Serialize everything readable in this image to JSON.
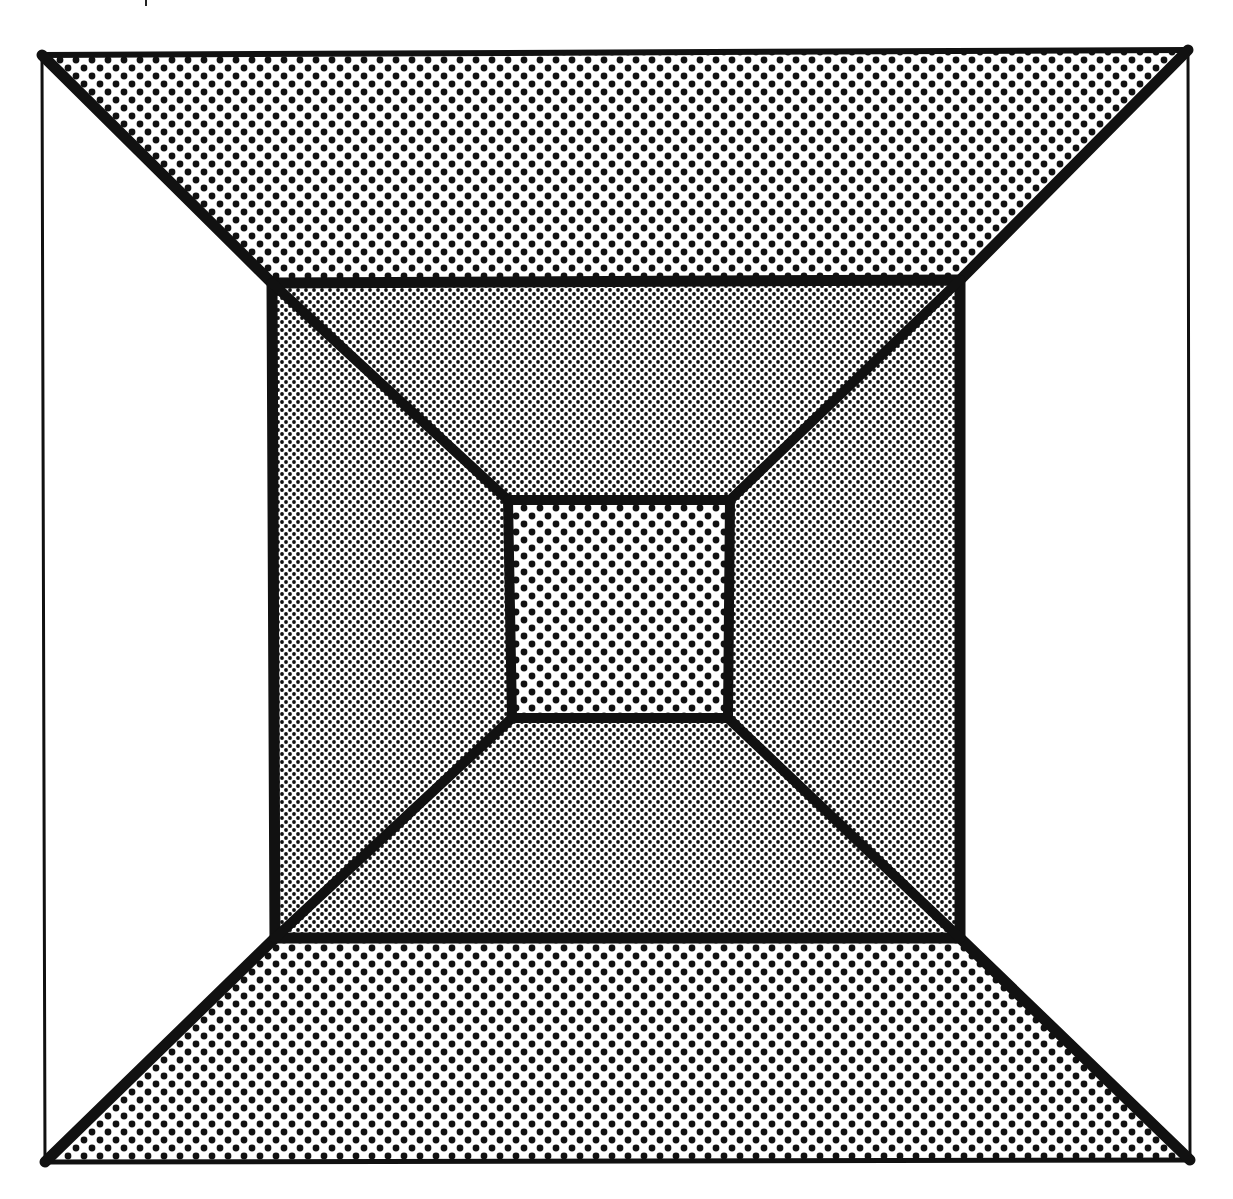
{
  "page": {
    "running_header": {
      "separator_visible": true
    }
  },
  "figure": {
    "colors": {
      "ink": "#111111",
      "paper": "#ffffff"
    },
    "outer_frame": {
      "tl": [
        42,
        55
      ],
      "tr": [
        1188,
        50
      ],
      "br": [
        1190,
        1160
      ],
      "bl": [
        45,
        1162
      ]
    },
    "middle_square": {
      "tl": [
        272,
        283
      ],
      "tr": [
        960,
        280
      ],
      "br": [
        960,
        938
      ],
      "bl": [
        275,
        938
      ]
    },
    "inner_square": {
      "tl": [
        508,
        500
      ],
      "tr": [
        730,
        500
      ],
      "br": [
        728,
        718
      ],
      "bl": [
        512,
        718
      ]
    },
    "regions": [
      {
        "name": "outer-top",
        "fill": "coarse-dots"
      },
      {
        "name": "outer-bottom",
        "fill": "coarse-dots"
      },
      {
        "name": "outer-left",
        "fill": "blank"
      },
      {
        "name": "outer-right",
        "fill": "blank"
      },
      {
        "name": "middle-top",
        "fill": "fine-dots"
      },
      {
        "name": "middle-bottom",
        "fill": "fine-dots"
      },
      {
        "name": "middle-left",
        "fill": "fine-dots"
      },
      {
        "name": "middle-right",
        "fill": "fine-dots"
      },
      {
        "name": "inner-center",
        "fill": "coarse-dots"
      }
    ],
    "patterns": {
      "coarse_spacing_px": 16,
      "coarse_dot_radius_px": 3.4,
      "fine_spacing_px": 8,
      "fine_dot_radius_px": 1.9
    }
  }
}
